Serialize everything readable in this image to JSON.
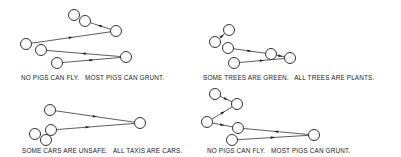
{
  "panels": [
    {
      "caption": "NO PIGS CAN FLY.   MOST PIGS CAN GRUNT.",
      "caption_pos": [
        21,
        74
      ],
      "nodes": [
        [
          74,
          15
        ],
        [
          85,
          21
        ],
        [
          116,
          31
        ],
        [
          26,
          44
        ],
        [
          41,
          50
        ],
        [
          126,
          57
        ],
        [
          57,
          63
        ]
      ],
      "edges": [
        {
          "from": 2,
          "to": 1,
          "arrow_t": 0.55
        },
        {
          "from": 3,
          "to": 2,
          "arrow_t": 0.5
        },
        {
          "from": 5,
          "to": 4,
          "arrow_t": 0.5
        },
        {
          "from": 6,
          "to": 5,
          "arrow_t": 0.5
        }
      ]
    },
    {
      "caption": "SOME TREES ARE GREEN.   ALL TREES ARE PLANTS.",
      "caption_pos": [
        203,
        74
      ],
      "nodes": [
        [
          229,
          30
        ],
        [
          215,
          42
        ],
        [
          228,
          48
        ],
        [
          271,
          54
        ],
        [
          290,
          58
        ],
        [
          234,
          63
        ]
      ],
      "edges": [
        {
          "from": 1,
          "to": 0,
          "arrow_t": 0.55
        },
        {
          "from": 2,
          "to": 3,
          "arrow_t": 0.5
        },
        {
          "from": 3,
          "to": 4,
          "arrow_t": 0.5
        },
        {
          "from": 5,
          "to": 4,
          "arrow_t": 0.5
        }
      ]
    },
    {
      "caption": "SOME CARS ARE UNSAFE.   ALL TAXIS ARE CARS.",
      "caption_pos": [
        22,
        147
      ],
      "nodes": [
        [
          50,
          110
        ],
        [
          140,
          123
        ],
        [
          51,
          130
        ],
        [
          35,
          134
        ],
        [
          46,
          140
        ]
      ],
      "edges": [
        {
          "from": 0,
          "to": 1,
          "arrow_t": 0.5
        },
        {
          "from": 2,
          "to": 1,
          "arrow_t": 0.4
        }
      ]
    },
    {
      "caption": "NO PIGS CAN FLY.   MOST PIGS CAN GRUNT.",
      "caption_pos": [
        207,
        147
      ],
      "nodes": [
        [
          215,
          94
        ],
        [
          237,
          104
        ],
        [
          207,
          122
        ],
        [
          238,
          128
        ],
        [
          314,
          135
        ],
        [
          232,
          140
        ]
      ],
      "edges": [
        {
          "from": 0,
          "to": 1,
          "arrow_t": 0.5
        },
        {
          "from": 2,
          "to": 1,
          "arrow_t": 0.55
        },
        {
          "from": 2,
          "to": 3,
          "arrow_t": 0.5
        },
        {
          "from": 4,
          "to": 3,
          "arrow_t": 0.5
        },
        {
          "from": 5,
          "to": 4,
          "arrow_t": 0.5
        }
      ]
    }
  ],
  "style": {
    "node_radius": 5.5,
    "stroke_color": "#333333"
  }
}
